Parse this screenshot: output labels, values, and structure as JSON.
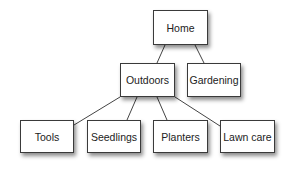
{
  "diagram": {
    "type": "tree",
    "nodes": [
      {
        "id": "home",
        "label": "Home"
      },
      {
        "id": "outdoors",
        "label": "Outdoors"
      },
      {
        "id": "gardening",
        "label": "Gardening"
      },
      {
        "id": "tools",
        "label": "Tools"
      },
      {
        "id": "seedlings",
        "label": "Seedlings"
      },
      {
        "id": "planters",
        "label": "Planters"
      },
      {
        "id": "lawncare",
        "label": "Lawn care"
      }
    ],
    "edges": [
      {
        "from": "home",
        "to": "outdoors"
      },
      {
        "from": "home",
        "to": "gardening"
      },
      {
        "from": "outdoors",
        "to": "tools"
      },
      {
        "from": "outdoors",
        "to": "seedlings"
      },
      {
        "from": "outdoors",
        "to": "planters"
      },
      {
        "from": "outdoors",
        "to": "lawncare"
      }
    ]
  }
}
